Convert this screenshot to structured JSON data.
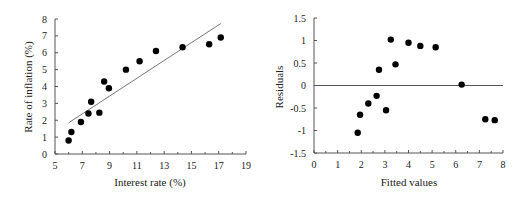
{
  "chart_data": [
    {
      "type": "scatter",
      "title": "",
      "xlabel": "Interest rate (%)",
      "ylabel": "Rate of inflation (%)",
      "xlim": [
        5,
        19
      ],
      "ylim": [
        0,
        8
      ],
      "xticks": [
        5,
        7,
        9,
        11,
        13,
        15,
        17,
        19
      ],
      "yticks": [
        0,
        1,
        2,
        3,
        4,
        5,
        6,
        7,
        8
      ],
      "grid": false,
      "legend": null,
      "series": [
        {
          "name": "observations",
          "x": [
            6.0,
            6.2,
            6.9,
            7.45,
            7.65,
            8.25,
            8.6,
            8.95,
            10.2,
            11.2,
            12.4,
            14.35,
            16.3,
            17.15
          ],
          "y": [
            0.8,
            1.3,
            1.9,
            2.4,
            3.1,
            2.45,
            4.3,
            3.9,
            5.0,
            5.5,
            6.1,
            6.33,
            6.5,
            6.9
          ]
        }
      ],
      "fit_line": {
        "x": [
          6.0,
          17.15
        ],
        "y": [
          1.85,
          7.73
        ]
      }
    },
    {
      "type": "scatter",
      "title": "",
      "xlabel": "Fitted values",
      "ylabel": "Residuals",
      "xlim": [
        0,
        8
      ],
      "ylim": [
        -1.5,
        1.5
      ],
      "xticks": [
        0,
        1,
        2,
        3,
        4,
        5,
        6,
        7,
        8
      ],
      "yticks": [
        -1.5,
        -1,
        -0.5,
        0,
        0.5,
        1,
        1.5
      ],
      "ytick_labels": [
        "-1.5",
        "-1",
        "-0.5",
        "0",
        "0.5",
        "1",
        "1.5"
      ],
      "grid": false,
      "legend": null,
      "zero_line": true,
      "series": [
        {
          "name": "residuals",
          "x": [
            1.85,
            1.95,
            2.3,
            2.65,
            2.75,
            3.05,
            3.25,
            3.45,
            4.0,
            4.5,
            5.15,
            6.25,
            7.25,
            7.65
          ],
          "y": [
            -1.05,
            -0.65,
            -0.4,
            -0.23,
            0.35,
            -0.55,
            1.02,
            0.47,
            0.95,
            0.88,
            0.85,
            0.02,
            -0.75,
            -0.77
          ]
        }
      ]
    }
  ],
  "colors": {
    "points": "#000000",
    "axis": "#555555",
    "fit_line": "#777777",
    "text": "#222222"
  }
}
